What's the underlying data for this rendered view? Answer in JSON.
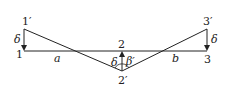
{
  "diagram": {
    "type": "beam displacement diagram",
    "stroke_color": "#222222",
    "points": {
      "p1": {
        "label": "1",
        "x": 24,
        "y": 51
      },
      "p1prime": {
        "label": "1′",
        "x": 24,
        "y": 29
      },
      "p2": {
        "label": "2",
        "x": 122,
        "y": 51
      },
      "p2prime": {
        "label": "2′",
        "x": 122,
        "y": 71
      },
      "p3": {
        "label": "3",
        "x": 207,
        "y": 51
      },
      "p3prime": {
        "label": "3′",
        "x": 207,
        "y": 29
      }
    },
    "labels": {
      "delta_left": "δ",
      "delta_mid": "δ",
      "delta_right": "δ",
      "segment_a": "a",
      "segment_b": "b",
      "angle": "β′"
    }
  }
}
